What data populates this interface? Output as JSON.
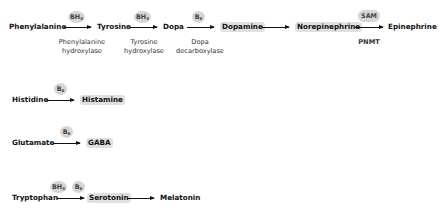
{
  "pathways": [
    {
      "name": "catecholamine",
      "nodes": [
        "Phenylalanine",
        "Tyrosine",
        "Dopa",
        "Dopamine",
        "Norepinephrine",
        "Epinephrine"
      ],
      "cofactors": [
        "BH",
        "BH",
        "B",
        "SAM"
      ],
      "cofactor_subs": [
        "4",
        "4",
        "6",
        ""
      ],
      "enzymes": [
        "Phenylalanine",
        "hydroxylase",
        "Tyrosine",
        "hydroxylase",
        "Dopa",
        "decarboxylase",
        "PNMT"
      ]
    },
    {
      "name": "histamine",
      "nodes": [
        "Histidine",
        "Histamine"
      ],
      "cofactors": [
        "B"
      ],
      "cofactor_subs": [
        "6"
      ]
    },
    {
      "name": "gaba",
      "nodes": [
        "Glutamate",
        "GABA"
      ],
      "cofactors": [
        "B"
      ],
      "cofactor_subs": [
        "6"
      ]
    },
    {
      "name": "serotonin",
      "nodes": [
        "Tryptophan",
        "Serotonin",
        "Melatonin"
      ],
      "cofactors": [
        "BH",
        "B"
      ],
      "cofactor_subs": [
        "4",
        "6"
      ]
    }
  ],
  "colors": {
    "highlight": "#e0e0e0",
    "cofactor": "#d6d6d6",
    "text": "#111111"
  }
}
